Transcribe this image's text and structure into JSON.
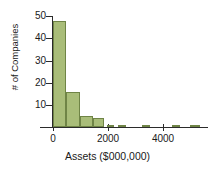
{
  "chart_data": {
    "type": "bar",
    "subtype": "histogram",
    "title": "",
    "subtitle": "",
    "xlabel": "Assets ($000,000)",
    "ylabel": "# of Companies",
    "xlim": [
      0,
      5750
    ],
    "ylim": [
      0,
      52
    ],
    "bin_width": 500,
    "grid": false,
    "legend": null,
    "xticks": [
      0,
      2000,
      4000
    ],
    "xtick_labels": [
      "0",
      "2000",
      "4000"
    ],
    "yticks": [
      10,
      20,
      30,
      40,
      50
    ],
    "ytick_labels": [
      "10",
      "20",
      "30",
      "40",
      "50"
    ],
    "bin_starts": [
      0,
      500,
      1000,
      1500,
      2000,
      2500,
      3000,
      3250,
      4250,
      4500,
      5250
    ],
    "values": [
      48,
      16,
      5,
      4,
      1,
      1,
      1,
      0,
      1,
      1,
      1
    ],
    "bars": [
      {
        "x0": 0,
        "x1": 500,
        "height": 48
      },
      {
        "x0": 500,
        "x1": 1000,
        "height": 16
      },
      {
        "x0": 1000,
        "x1": 1500,
        "height": 5
      },
      {
        "x0": 1500,
        "x1": 1900,
        "height": 4
      },
      {
        "x0": 2000,
        "x1": 2250,
        "height": 1
      },
      {
        "x0": 2400,
        "x1": 2700,
        "height": 1
      },
      {
        "x0": 3300,
        "x1": 3600,
        "height": 1
      },
      {
        "x0": 4400,
        "x1": 4700,
        "height": 1
      },
      {
        "x0": 5100,
        "x1": 5450,
        "height": 1
      }
    ],
    "colors": {
      "bar_fill": "#a9bd79",
      "bar_edge": "#6f8446",
      "axis": "#2b2b2b",
      "text": "#1a1a1a",
      "background": "#ffffff"
    }
  }
}
